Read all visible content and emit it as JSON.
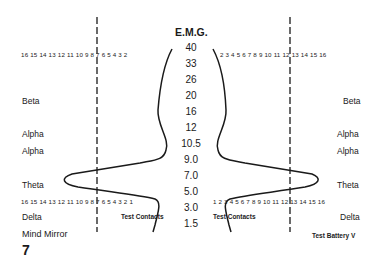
{
  "title": "E.M.G.",
  "emg_values": [
    "40",
    "33",
    "26",
    "20",
    "16",
    "12",
    "10.5",
    "9.0",
    "7.0",
    "5.0",
    "3.0",
    "1.5"
  ],
  "left_scale_top": "16 15 14 13 12 11 10 9 8 7 6 5 4 3 2",
  "right_scale_top": "2 3 4 5 6 7 8 9 10 11 12 13 14 15 16",
  "left_scale_bottom": "16 15 14 13 12 11 10 9 8 7 6 5 4 3 2 1",
  "right_scale_bottom": "1 2 3 4 5 6 7 8 9 10 11 12 13 14 15 16",
  "bands_left": [
    "Beta",
    "Alpha",
    "Alpha",
    "Theta",
    "Delta"
  ],
  "bands_right": [
    "Beta",
    "Alpha",
    "Alpha",
    "Theta",
    "Delta"
  ],
  "test_contacts_left": "Test Contacts",
  "test_contacts_right": "Test Contacts",
  "caption": "Mind Mirror",
  "figure_number": "7",
  "test_battery": "Test Battery V",
  "colors": {
    "ink": "#1a1a1a",
    "background": "#ffffff"
  }
}
